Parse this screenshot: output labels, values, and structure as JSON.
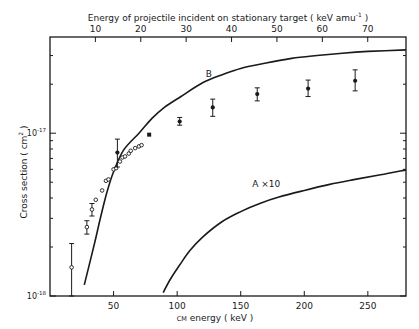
{
  "chart_data": {
    "type": "scatter",
    "title": "",
    "top_axis": {
      "label": "Energy of projectile incident on stationary target ( keV amu",
      "label_superscript": "-1",
      "label_suffix": " )",
      "ticks": [
        10,
        20,
        30,
        40,
        50,
        60,
        70
      ],
      "tick_labels": [
        "10",
        "20",
        "30",
        "40",
        "50",
        "60",
        "70"
      ],
      "cm_per_amu_factor": 3.57
    },
    "xlabel": "CM energy ( keV )",
    "xlabel_parts": {
      "small_caps": "CM",
      "rest": " energy ( keV )"
    },
    "ylabel": "Cross section ( cm",
    "ylabel_superscript": "2",
    "ylabel_suffix": " )",
    "xlim": [
      0,
      280
    ],
    "ylim": [
      1e-18,
      3.9e-17
    ],
    "yscale": "log",
    "x_ticks": [
      50,
      100,
      150,
      200,
      250
    ],
    "x_tick_labels": [
      "50",
      "100",
      "150",
      "200",
      "250"
    ],
    "y_tick_labels": [
      {
        "value": 1e-17,
        "base": "10",
        "exp": "-17"
      },
      {
        "value": 1e-18,
        "base": "10",
        "exp": "-18"
      }
    ],
    "y_minor_ticks": [
      2e-18,
      3e-18,
      4e-18,
      5e-18,
      6e-18,
      7e-18,
      8e-18,
      9e-18,
      2e-17,
      3e-17
    ],
    "grid": false,
    "series": [
      {
        "name": "B",
        "kind": "curve",
        "label": "B",
        "x": [
          27,
          35,
          40,
          45,
          50,
          58,
          70,
          80,
          90,
          103,
          120,
          135,
          150,
          170,
          190,
          210,
          230,
          250,
          280
        ],
        "y": [
          1.17e-18,
          2.1e-18,
          3.1e-18,
          4.4e-18,
          5.8e-18,
          7.9e-18,
          1e-17,
          1.23e-17,
          1.44e-17,
          1.68e-17,
          2.04e-17,
          2.28e-17,
          2.5e-17,
          2.7e-17,
          2.88e-17,
          3e-17,
          3.1e-17,
          3.18e-17,
          3.25e-17
        ]
      },
      {
        "name": "A x10",
        "kind": "curve",
        "label": "A ×10",
        "x": [
          89,
          95,
          102,
          110,
          120,
          135,
          150,
          165,
          180,
          200,
          220,
          240,
          260,
          280
        ],
        "y": [
          1.05e-18,
          1.28e-18,
          1.55e-18,
          1.9e-18,
          2.3e-18,
          2.85e-18,
          3.3e-18,
          3.7e-18,
          4.05e-18,
          4.45e-18,
          4.85e-18,
          5.2e-18,
          5.55e-18,
          5.95e-18
        ]
      },
      {
        "name": "Open circles",
        "kind": "open-circle",
        "points": [
          {
            "x": 17,
            "y": 1.5e-18,
            "err_lo": 1e-18,
            "err_hi": 2.1e-18
          },
          {
            "x": 29,
            "y": 2.65e-18,
            "err_lo": 2.4e-18,
            "err_hi": 2.9e-18
          },
          {
            "x": 33,
            "y": 3.4e-18,
            "err_lo": 3.1e-18,
            "err_hi": 3.7e-18
          },
          {
            "x": 36,
            "y": 3.9e-18
          },
          {
            "x": 41,
            "y": 4.45e-18
          },
          {
            "x": 44,
            "y": 5.1e-18
          },
          {
            "x": 46,
            "y": 5.2e-18
          },
          {
            "x": 50,
            "y": 6e-18
          },
          {
            "x": 52,
            "y": 6.1e-18
          },
          {
            "x": 55,
            "y": 6.7e-18
          },
          {
            "x": 57,
            "y": 7.1e-18
          },
          {
            "x": 59,
            "y": 7.2e-18
          },
          {
            "x": 62,
            "y": 7.5e-18
          },
          {
            "x": 63.5,
            "y": 7.8e-18
          },
          {
            "x": 67,
            "y": 8.1e-18
          },
          {
            "x": 70,
            "y": 8.3e-18
          },
          {
            "x": 72,
            "y": 8.45e-18
          }
        ]
      },
      {
        "name": "Filled points",
        "kind": "filled-circle",
        "points": [
          {
            "x": 53,
            "y": 7.6e-18,
            "err_lo": 6.2e-18,
            "err_hi": 9.2e-18
          },
          {
            "x": 102,
            "y": 1.18e-17,
            "err_lo": 1.12e-17,
            "err_hi": 1.25e-17
          },
          {
            "x": 128,
            "y": 1.44e-17,
            "err_lo": 1.27e-17,
            "err_hi": 1.62e-17
          },
          {
            "x": 163,
            "y": 1.74e-17,
            "err_lo": 1.58e-17,
            "err_hi": 1.9e-17
          },
          {
            "x": 203,
            "y": 1.88e-17,
            "err_lo": 1.68e-17,
            "err_hi": 2.12e-17
          },
          {
            "x": 240,
            "y": 2.1e-17,
            "err_lo": 1.82e-17,
            "err_hi": 2.45e-17
          }
        ]
      },
      {
        "name": "Filled square",
        "kind": "filled-square",
        "points": [
          {
            "x": 78,
            "y": 9.8e-18
          }
        ]
      }
    ],
    "annotations": [
      {
        "text": "B",
        "x": 125,
        "y": 2.2e-17
      },
      {
        "text": "A ×10",
        "x": 170,
        "y": 4.7e-18
      }
    ]
  }
}
